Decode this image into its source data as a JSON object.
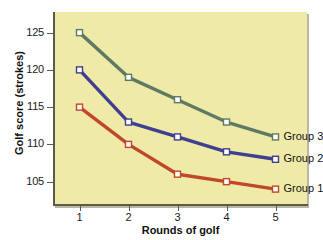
{
  "chart_data": {
    "type": "line",
    "title": "",
    "xlabel": "Rounds of golf",
    "ylabel": "Golf score (strokes)",
    "categories": [
      1,
      2,
      3,
      4,
      5
    ],
    "x": [
      1,
      2,
      3,
      4,
      5
    ],
    "xticklabels": [
      "1",
      "2",
      "3",
      "4",
      "5"
    ],
    "yticks": [
      105,
      110,
      115,
      120,
      125
    ],
    "yticklabels": [
      "105",
      "110",
      "115",
      "120",
      "125"
    ],
    "ylim": [
      102,
      127.5
    ],
    "xlim": [
      0.5,
      5.5
    ],
    "grid": false,
    "legend_position": "right-inline",
    "plot_background": "#efeaa8",
    "series": [
      {
        "name": "Group 3",
        "color": "#5f7a63",
        "marker": "square",
        "marker_face": "#ffffff",
        "values": [
          125,
          119,
          116,
          113,
          111
        ]
      },
      {
        "name": "Group 2",
        "color": "#3f3f8f",
        "marker": "square",
        "marker_face": "#ffffff",
        "values": [
          120,
          113,
          111,
          109,
          108
        ]
      },
      {
        "name": "Group 1",
        "color": "#c0472a",
        "marker": "square",
        "marker_face": "#ffffff",
        "values": [
          115,
          110,
          106,
          105,
          104
        ]
      }
    ]
  },
  "legend": {
    "items": [
      {
        "label": "Group 3",
        "color": "#5f7a63"
      },
      {
        "label": "Group 2",
        "color": "#3f3f8f"
      },
      {
        "label": "Group 1",
        "color": "#c0472a"
      }
    ]
  },
  "colors": {
    "panel": "#efeaa8",
    "axis": "#5a5a4e",
    "text": "#111111",
    "group3": "#5f7a63",
    "group2": "#3f3f8f",
    "group1": "#c0472a"
  }
}
